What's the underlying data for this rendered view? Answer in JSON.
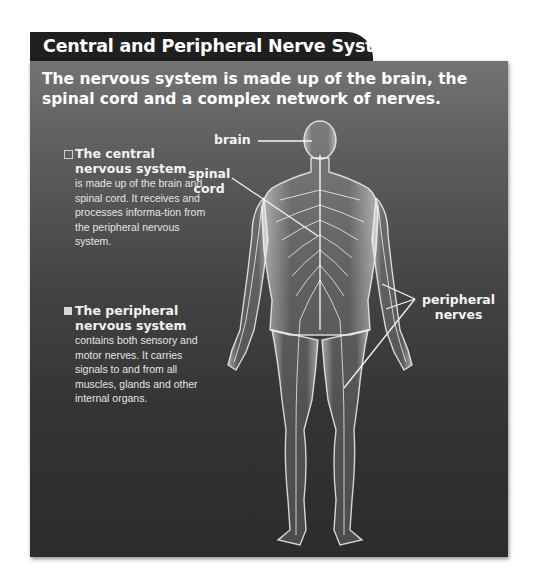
{
  "title": "Central and Peripheral Nerve Systems",
  "subtitle": "The nervous system is made up of the brain, the spinal cord and a complex network of nerves.",
  "bullets": [
    {
      "marker": "open-square",
      "heading": "The central nervous system",
      "body": "is made up of the brain and spinal cord. It receives and processes informa-tion from the peripheral nervous system."
    },
    {
      "marker": "filled-square",
      "heading": "The peripheral nervous system",
      "body": "contains both sensory and motor nerves. It carries signals to and from all muscles, glands and other internal organs."
    }
  ],
  "labels": {
    "brain": "brain",
    "spinal_cord_line1": "spinal",
    "spinal_cord_line2": "cord",
    "peripheral_line1": "peripheral",
    "peripheral_line2": "nerves"
  },
  "illustration": "human-body-nervous-system-back-view",
  "colors": {
    "title_bar": "#1f1f1f",
    "panel_top": "#737373",
    "panel_bottom": "#2c2c2c",
    "text": "#ffffff",
    "figure": "#e8e8e8"
  }
}
